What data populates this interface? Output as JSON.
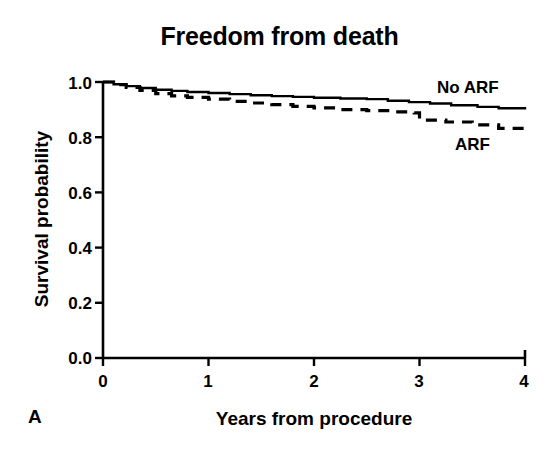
{
  "figure": {
    "panel_label": "A",
    "title": "Freedom from death"
  },
  "axes": {
    "x_title": "Years from procedure",
    "y_title": "Survival probability",
    "x_ticks": [
      "0",
      "1",
      "2",
      "3",
      "4"
    ],
    "y_ticks": [
      "0.0",
      "0.2",
      "0.4",
      "0.6",
      "0.8",
      "1.0"
    ]
  },
  "series_labels": {
    "no_arf": "No ARF",
    "arf": "ARF"
  },
  "colors": {
    "ink": "#000000",
    "background": "#ffffff"
  },
  "chart_data": {
    "type": "line",
    "title": "Freedom from death",
    "subtitle": "",
    "xlabel": "Years from procedure",
    "ylabel": "Survival probability",
    "xlim": [
      0,
      4
    ],
    "ylim": [
      0.0,
      1.0
    ],
    "x_ticks": [
      0,
      1,
      2,
      3,
      4
    ],
    "y_ticks": [
      0.0,
      0.2,
      0.4,
      0.6,
      0.8,
      1.0
    ],
    "grid": false,
    "legend": "inline-annotations-right",
    "panel": "A",
    "series": [
      {
        "name": "No ARF",
        "style": "solid",
        "color": "#000000",
        "step": true,
        "points": [
          [
            0.0,
            1.0
          ],
          [
            0.1,
            0.992
          ],
          [
            0.22,
            0.985
          ],
          [
            0.35,
            0.978
          ],
          [
            0.5,
            0.972
          ],
          [
            0.65,
            0.968
          ],
          [
            0.8,
            0.964
          ],
          [
            1.0,
            0.96
          ],
          [
            1.2,
            0.956
          ],
          [
            1.4,
            0.952
          ],
          [
            1.6,
            0.949
          ],
          [
            1.8,
            0.946
          ],
          [
            2.0,
            0.943
          ],
          [
            2.25,
            0.94
          ],
          [
            2.5,
            0.938
          ],
          [
            2.7,
            0.932
          ],
          [
            2.9,
            0.927
          ],
          [
            3.1,
            0.922
          ],
          [
            3.3,
            0.916
          ],
          [
            3.55,
            0.91
          ],
          [
            3.75,
            0.905
          ],
          [
            4.0,
            0.9
          ]
        ]
      },
      {
        "name": "ARF",
        "style": "dashed",
        "color": "#000000",
        "step": true,
        "points": [
          [
            0.0,
            1.0
          ],
          [
            0.1,
            0.99
          ],
          [
            0.22,
            0.98
          ],
          [
            0.35,
            0.97
          ],
          [
            0.5,
            0.958
          ],
          [
            0.65,
            0.95
          ],
          [
            0.8,
            0.944
          ],
          [
            1.0,
            0.938
          ],
          [
            1.2,
            0.93
          ],
          [
            1.4,
            0.924
          ],
          [
            1.6,
            0.918
          ],
          [
            1.8,
            0.912
          ],
          [
            2.0,
            0.906
          ],
          [
            2.25,
            0.9
          ],
          [
            2.5,
            0.896
          ],
          [
            2.75,
            0.892
          ],
          [
            2.95,
            0.888
          ],
          [
            3.0,
            0.862
          ],
          [
            3.25,
            0.855
          ],
          [
            3.5,
            0.845
          ],
          [
            3.75,
            0.832
          ],
          [
            4.0,
            0.822
          ]
        ]
      }
    ],
    "endpoint_values": {
      "no_arf_at_4y": 0.9,
      "arf_at_4y": 0.82
    }
  }
}
